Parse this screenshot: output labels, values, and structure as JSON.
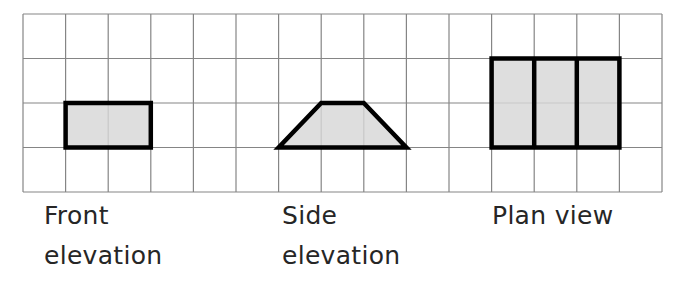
{
  "figure": {
    "grid": {
      "origin_x": 23,
      "origin_y": 14,
      "cols": 15,
      "rows": 4,
      "cell_width": 42.6,
      "cell_height": 44.5,
      "line_color": "#858585",
      "line_width": 1.2
    },
    "shape_style": {
      "fill_color": "#d7d7d7",
      "fill_opacity": 0.82,
      "stroke_color": "#000000",
      "stroke_width": 4.5
    },
    "shapes": [
      {
        "name": "front-elevation-shape",
        "description": "rectangle 2 cells wide by 1 cell tall",
        "cells_polygon": [
          [
            1,
            2
          ],
          [
            3,
            2
          ],
          [
            3,
            3
          ],
          [
            1,
            3
          ]
        ]
      },
      {
        "name": "side-elevation-shape",
        "description": "trapezoid, bottom 3 cells, top 1 cell, height 1 cell",
        "cells_polygon": [
          [
            7,
            2
          ],
          [
            8,
            2
          ],
          [
            9,
            3
          ],
          [
            6,
            3
          ]
        ]
      },
      {
        "name": "plan-view-shape",
        "description": "rectangle 3 cells wide by 2 cells tall split into three 1-cell columns",
        "cells_polygon": [
          [
            11,
            1
          ],
          [
            14,
            1
          ],
          [
            14,
            3
          ],
          [
            11,
            3
          ]
        ],
        "internal_lines": [
          [
            [
              12,
              1
            ],
            [
              12,
              3
            ]
          ],
          [
            [
              13,
              1
            ],
            [
              13,
              3
            ]
          ]
        ]
      }
    ],
    "labels": {
      "front": {
        "line1": "Front",
        "line2": "elevation"
      },
      "side": {
        "line1": "Side",
        "line2": "elevation"
      },
      "plan": {
        "line1": "Plan view"
      }
    },
    "text_color": "#262626",
    "background_color": "#ffffff"
  }
}
